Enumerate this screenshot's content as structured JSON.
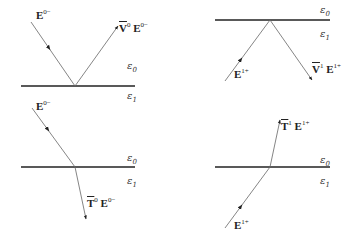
{
  "diagram": {
    "title": "",
    "colors": {
      "interface_line": "#222222",
      "ray": "#555555",
      "text": "#222222"
    },
    "panels": [
      {
        "id": "reflection-from-medium-0",
        "interface": {
          "y": 86,
          "x1": 21,
          "x2": 135
        },
        "media": {
          "upper": {
            "symbol": "ε",
            "index": "0"
          },
          "lower": {
            "symbol": "ε",
            "index": "1"
          }
        },
        "rays": [
          {
            "role": "incident",
            "label": {
              "base": "E",
              "sup": "0−"
            },
            "from": [
              31,
              22
            ],
            "to": [
              75,
              86
            ]
          },
          {
            "role": "reflected",
            "label": {
              "operator": "V",
              "op_sup": "0",
              "base": "E",
              "sup": "0−"
            },
            "from": [
              75,
              86
            ],
            "to": [
              118,
              25
            ]
          }
        ]
      },
      {
        "id": "reflection-from-medium-1",
        "interface": {
          "y": 20,
          "x1": 215,
          "x2": 330
        },
        "media": {
          "upper": {
            "symbol": "ε",
            "index": "0"
          },
          "lower": {
            "symbol": "ε",
            "index": "1"
          }
        },
        "rays": [
          {
            "role": "incident",
            "label": {
              "base": "E",
              "sup": "1+"
            },
            "from": [
              225,
              81
            ],
            "to": [
              270,
              20
            ]
          },
          {
            "role": "reflected",
            "label": {
              "operator": "V",
              "op_sup": "1",
              "base": "E",
              "sup": "1+"
            },
            "from": [
              270,
              20
            ],
            "to": [
              312,
              80
            ]
          }
        ]
      },
      {
        "id": "transmission-from-medium-0",
        "interface": {
          "y": 167,
          "x1": 21,
          "x2": 135
        },
        "media": {
          "upper": {
            "symbol": "ε",
            "index": "0"
          },
          "lower": {
            "symbol": "ε",
            "index": "1"
          }
        },
        "rays": [
          {
            "role": "incident",
            "label": {
              "base": "E",
              "sup": "0−"
            },
            "from": [
              32,
              108
            ],
            "to": [
              75,
              167
            ]
          },
          {
            "role": "transmitted",
            "label": {
              "operator": "T",
              "op_sup": "0",
              "base": "E",
              "sup": "0−"
            },
            "from": [
              75,
              167
            ],
            "to": [
              86,
              219
            ]
          }
        ]
      },
      {
        "id": "transmission-from-medium-1",
        "interface": {
          "y": 167,
          "x1": 215,
          "x2": 330
        },
        "media": {
          "upper": {
            "symbol": "ε",
            "index": "0"
          },
          "lower": {
            "symbol": "ε",
            "index": "1"
          }
        },
        "rays": [
          {
            "role": "incident",
            "label": {
              "base": "E",
              "sup": "1+"
            },
            "from": [
              225,
              228
            ],
            "to": [
              270,
              167
            ]
          },
          {
            "role": "transmitted",
            "label": {
              "operator": "T",
              "op_sup": "1",
              "base": "E",
              "sup": "1+"
            },
            "from": [
              270,
              167
            ],
            "to": [
              280,
              120
            ]
          }
        ]
      }
    ],
    "labels": {
      "p1_incident": {
        "base": "E",
        "sup": "0−"
      },
      "p1_reflected": {
        "op": "V",
        "op_sup": "0",
        "base": "E",
        "sup": "0−"
      },
      "p1_eps0": {
        "sym": "ε",
        "idx": "0"
      },
      "p1_eps1": {
        "sym": "ε",
        "idx": "1"
      },
      "p2_incident": {
        "base": "E",
        "sup": "1+"
      },
      "p2_reflected": {
        "op": "V",
        "op_sup": "1",
        "base": "E",
        "sup": "1+"
      },
      "p2_eps0": {
        "sym": "ε",
        "idx": "0"
      },
      "p2_eps1": {
        "sym": "ε",
        "idx": "1"
      },
      "p3_incident": {
        "base": "E",
        "sup": "0−"
      },
      "p3_transmitted": {
        "op": "T",
        "op_sup": "0",
        "base": "E",
        "sup": "0−"
      },
      "p3_eps0": {
        "sym": "ε",
        "idx": "0"
      },
      "p3_eps1": {
        "sym": "ε",
        "idx": "1"
      },
      "p4_incident": {
        "base": "E",
        "sup": "1+"
      },
      "p4_transmitted": {
        "op": "T",
        "op_sup": "1",
        "base": "E",
        "sup": "1+"
      },
      "p4_eps0": {
        "sym": "ε",
        "idx": "0"
      },
      "p4_eps1": {
        "sym": "ε",
        "idx": "1"
      }
    }
  }
}
